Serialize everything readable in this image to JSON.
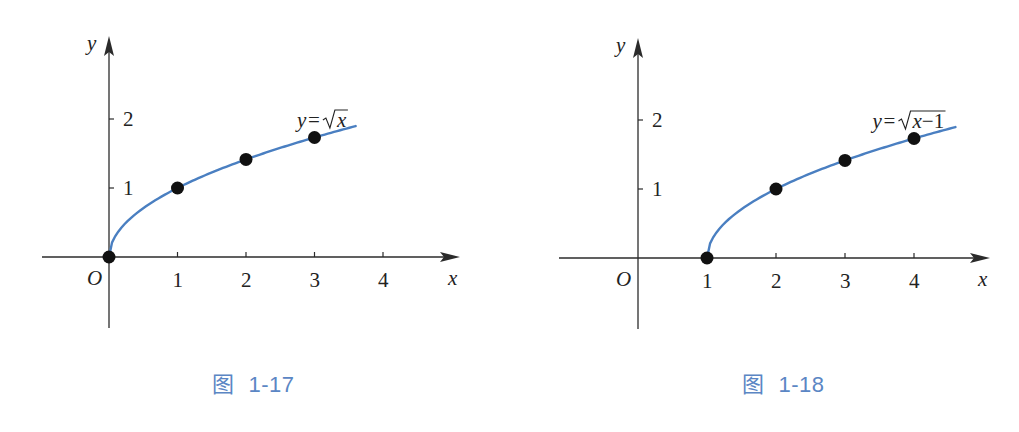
{
  "colors": {
    "curve": "#4a7fc1",
    "caption": "#5b86c4",
    "axis": "#2b2b2b",
    "point": "#111111"
  },
  "chart_data": [
    {
      "type": "line",
      "title": "",
      "caption": {
        "glyph": "图",
        "number": "1-17"
      },
      "function_label": {
        "lhs": "y",
        "eq": "=",
        "radicand": "x"
      },
      "xlabel": "x",
      "ylabel": "y",
      "origin_label": "O",
      "x_ticks": [
        1,
        2,
        3,
        4
      ],
      "y_ticks": [
        1,
        2
      ],
      "xlim": [
        -1,
        5
      ],
      "ylim": [
        -1,
        3
      ],
      "grid": false,
      "curve_domain": [
        0,
        3.6
      ],
      "series": [
        {
          "name": "y=√x",
          "x": [
            0,
            1,
            2,
            3
          ],
          "y": [
            0,
            1,
            1.414,
            1.732
          ]
        }
      ],
      "layout": {
        "ox": 109,
        "oy": 257,
        "ux": 68.5,
        "uy": 69,
        "x_axis_from": 42,
        "x_axis_to": 460,
        "y_axis_top": 36,
        "y_axis_bottom": 328
      }
    },
    {
      "type": "line",
      "title": "",
      "caption": {
        "glyph": "图",
        "number": "1-18"
      },
      "function_label": {
        "lhs": "y",
        "eq": "=",
        "radicand": "x−1"
      },
      "xlabel": "x",
      "ylabel": "y",
      "origin_label": "O",
      "x_ticks": [
        1,
        2,
        3,
        4
      ],
      "y_ticks": [
        1,
        2
      ],
      "xlim": [
        -1,
        5
      ],
      "ylim": [
        -1,
        3
      ],
      "grid": false,
      "curve_domain": [
        1,
        4.6
      ],
      "series": [
        {
          "name": "y=√(x−1)",
          "x": [
            1,
            2,
            3,
            4
          ],
          "y": [
            0,
            1,
            1.414,
            1.732
          ]
        }
      ],
      "layout": {
        "ox": 128,
        "oy": 258,
        "ux": 69,
        "uy": 69,
        "x_axis_from": 49,
        "x_axis_to": 480,
        "y_axis_top": 38,
        "y_axis_bottom": 329
      }
    }
  ]
}
